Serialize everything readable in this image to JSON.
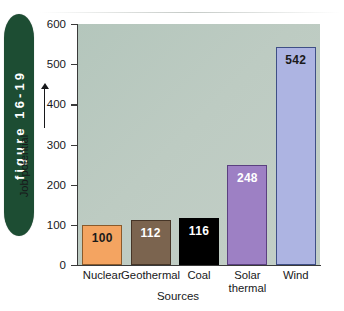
{
  "figure": {
    "tab_label": "figure 16-19"
  },
  "chart_data": {
    "type": "bar",
    "title": "",
    "xlabel": "Sources",
    "ylabel": "Job potential",
    "categories": [
      "Nuclear",
      "Geothermal",
      "Coal",
      "Solar thermal",
      "Wind"
    ],
    "category_lines": [
      [
        "Nuclear"
      ],
      [
        "Geothermal"
      ],
      [
        "Coal"
      ],
      [
        "Solar",
        "thermal"
      ],
      [
        "Wind"
      ]
    ],
    "values": [
      100,
      112,
      116,
      248,
      542
    ],
    "value_labels": [
      "100",
      "112",
      "116",
      "248",
      "542"
    ],
    "ylim": [
      0,
      600
    ],
    "yticks": [
      0,
      100,
      200,
      300,
      400,
      500,
      600
    ],
    "ytick_labels": [
      "0",
      "100",
      "200",
      "300",
      "400",
      "500",
      "600"
    ],
    "grid": false,
    "legend": "none",
    "bar_colors": [
      "#f0a濾",
      "#7b644f",
      "#000000",
      "#9d80c4",
      "#adb4e2"
    ],
    "colors": {
      "nuclear_fill": "#f3a straightforward",
      "plot_background": "#bdcbc2",
      "tab_green": "#1d4d33",
      "axis": "#3a3a3a"
    },
    "series_style": [
      {
        "name": "Nuclear",
        "fill": "#f4a461",
        "border": "#8a5a2b",
        "label_color": "#1a1a1a"
      },
      {
        "name": "Geothermal",
        "fill": "#7b644f",
        "border": "#463527",
        "label_color": "#ffffff"
      },
      {
        "name": "Coal",
        "fill": "#000000",
        "border": "#000000",
        "label_color": "#ffffff"
      },
      {
        "name": "Solar thermal",
        "fill": "#9d80c4",
        "border": "#5b4080",
        "label_color": "#ffffff"
      },
      {
        "name": "Wind",
        "fill": "#adb4e2",
        "border": "#3f4f86",
        "label_color": "#1a1a1a"
      }
    ]
  }
}
